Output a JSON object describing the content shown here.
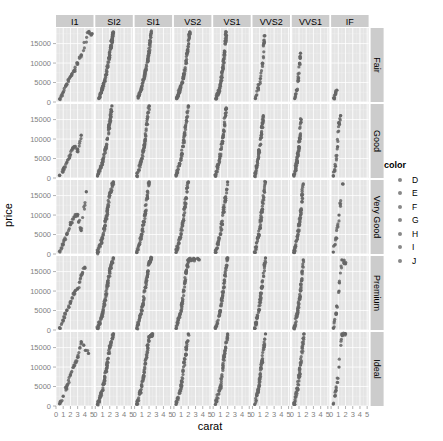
{
  "chart_data": {
    "type": "scatter",
    "title": "",
    "xlabel": "carat",
    "ylabel": "price",
    "facet_columns": [
      "I1",
      "SI2",
      "SI1",
      "VS2",
      "VS1",
      "VVS2",
      "VVS1",
      "IF"
    ],
    "facet_rows": [
      "Fair",
      "Good",
      "Very Good",
      "Premium",
      "Ideal"
    ],
    "x_ticks": [
      "0",
      "1",
      "2",
      "3",
      "4",
      "5"
    ],
    "xlim": [
      0,
      5.2
    ],
    "y_ticks": [
      "0",
      "5000",
      "10000",
      "15000"
    ],
    "ylim": [
      0,
      19000
    ],
    "grid": true,
    "legend": {
      "title": "color",
      "entries": [
        "D",
        "E",
        "F",
        "G",
        "H",
        "I",
        "J"
      ],
      "position": "right"
    },
    "point_color": "#666666",
    "panel_background": "#e5e5e5",
    "strip_background": "#cccccc",
    "approx_series": {
      "Fair": {
        "I1": [
          [
            0.5,
            800
          ],
          [
            1,
            2500
          ],
          [
            1.5,
            4500
          ],
          [
            2,
            6500
          ],
          [
            2.5,
            8000
          ],
          [
            3,
            10000
          ],
          [
            3.5,
            12000
          ],
          [
            4.5,
            18000
          ],
          [
            5,
            17500
          ]
        ],
        "SI2": [
          [
            0.5,
            900
          ],
          [
            1,
            3500
          ],
          [
            1.5,
            7000
          ],
          [
            2,
            12000
          ],
          [
            2.3,
            16000
          ],
          [
            2.5,
            18000
          ]
        ],
        "SI1": [
          [
            0.5,
            1000
          ],
          [
            1,
            4000
          ],
          [
            1.5,
            8000
          ],
          [
            2,
            12500
          ],
          [
            2.3,
            18000
          ]
        ],
        "VS2": [
          [
            0.4,
            900
          ],
          [
            0.9,
            3500
          ],
          [
            1.4,
            7000
          ],
          [
            1.9,
            13000
          ],
          [
            2.2,
            18000
          ]
        ],
        "VS1": [
          [
            0.4,
            900
          ],
          [
            0.9,
            3500
          ],
          [
            1.3,
            8000
          ],
          [
            1.6,
            13000
          ],
          [
            1.8,
            18000
          ]
        ],
        "VVS2": [
          [
            0.4,
            900
          ],
          [
            0.8,
            3500
          ],
          [
            1.1,
            6000
          ],
          [
            1.4,
            10000
          ],
          [
            1.6,
            15000
          ],
          [
            1.7,
            17000
          ]
        ],
        "VVS1": [
          [
            0.4,
            900
          ],
          [
            0.7,
            3000
          ],
          [
            0.9,
            6000
          ],
          [
            1.1,
            10000
          ],
          [
            1.2,
            12500
          ]
        ],
        "IF": [
          [
            0.4,
            900
          ],
          [
            0.6,
            2000
          ],
          [
            0.8,
            3000
          ]
        ]
      },
      "Good": {
        "I1": [
          [
            0.5,
            700
          ],
          [
            1,
            2200
          ],
          [
            1.5,
            4000
          ],
          [
            2,
            6000
          ],
          [
            2.5,
            8000
          ],
          [
            3,
            7000
          ],
          [
            3.5,
            11000
          ]
        ],
        "SI2": [
          [
            0.3,
            500
          ],
          [
            1,
            4000
          ],
          [
            1.5,
            8000
          ],
          [
            2,
            14000
          ],
          [
            2.3,
            18500
          ]
        ],
        "SI1": [
          [
            0.3,
            500
          ],
          [
            1,
            5000
          ],
          [
            1.5,
            10000
          ],
          [
            2,
            18500
          ]
        ],
        "VS2": [
          [
            0.3,
            500
          ],
          [
            1,
            5000
          ],
          [
            1.5,
            11000
          ],
          [
            2,
            18500
          ]
        ],
        "VS1": [
          [
            0.3,
            500
          ],
          [
            0.9,
            5000
          ],
          [
            1.4,
            11000
          ],
          [
            1.8,
            18000
          ]
        ],
        "VVS2": [
          [
            0.3,
            500
          ],
          [
            0.8,
            5000
          ],
          [
            1.2,
            11000
          ],
          [
            1.5,
            16000
          ]
        ],
        "VVS1": [
          [
            0.3,
            500
          ],
          [
            0.7,
            4000
          ],
          [
            1,
            8000
          ],
          [
            1.3,
            15000
          ]
        ],
        "IF": [
          [
            0.3,
            600
          ],
          [
            0.6,
            3000
          ],
          [
            0.9,
            8000
          ],
          [
            1.1,
            14000
          ],
          [
            1.3,
            16000
          ]
        ]
      },
      "Very Good": {
        "I1": [
          [
            0.5,
            700
          ],
          [
            1,
            2500
          ],
          [
            1.5,
            5000
          ],
          [
            2,
            7500
          ],
          [
            2.5,
            9500
          ],
          [
            3,
            10000
          ],
          [
            3.5,
            6000
          ],
          [
            4.2,
            16000
          ]
        ],
        "SI2": [
          [
            0.3,
            400
          ],
          [
            1,
            4000
          ],
          [
            1.5,
            9000
          ],
          [
            2,
            15000
          ],
          [
            2.5,
            18500
          ]
        ],
        "SI1": [
          [
            0.3,
            400
          ],
          [
            1,
            5000
          ],
          [
            1.5,
            11000
          ],
          [
            2,
            18500
          ]
        ],
        "VS2": [
          [
            0.3,
            400
          ],
          [
            1,
            5000
          ],
          [
            1.5,
            12000
          ],
          [
            2,
            18500
          ]
        ],
        "VS1": [
          [
            0.3,
            400
          ],
          [
            1,
            5000
          ],
          [
            1.5,
            12000
          ],
          [
            2,
            18500
          ]
        ],
        "VVS2": [
          [
            0.3,
            400
          ],
          [
            0.9,
            5000
          ],
          [
            1.3,
            11000
          ],
          [
            1.8,
            18500
          ]
        ],
        "VVS1": [
          [
            0.3,
            400
          ],
          [
            0.8,
            4500
          ],
          [
            1.2,
            10000
          ],
          [
            1.6,
            18000
          ]
        ],
        "IF": [
          [
            0.3,
            500
          ],
          [
            0.7,
            4000
          ],
          [
            1.1,
            10000
          ],
          [
            1.6,
            18000
          ]
        ]
      },
      "Premium": {
        "I1": [
          [
            0.5,
            600
          ],
          [
            1,
            2500
          ],
          [
            1.5,
            5000
          ],
          [
            2,
            7000
          ],
          [
            2.5,
            9500
          ],
          [
            3,
            10500
          ],
          [
            3.5,
            14000
          ],
          [
            4,
            16000
          ]
        ],
        "SI2": [
          [
            0.3,
            400
          ],
          [
            1,
            4000
          ],
          [
            1.5,
            9000
          ],
          [
            2,
            15000
          ],
          [
            2.5,
            18500
          ]
        ],
        "SI1": [
          [
            0.3,
            400
          ],
          [
            1,
            5000
          ],
          [
            1.5,
            11000
          ],
          [
            2,
            17000
          ],
          [
            2.3,
            18500
          ]
        ],
        "VS2": [
          [
            0.3,
            400
          ],
          [
            1,
            5000
          ],
          [
            1.5,
            12000
          ],
          [
            2,
            18000
          ],
          [
            3.5,
            18000
          ]
        ],
        "VS1": [
          [
            0.3,
            400
          ],
          [
            1,
            5000
          ],
          [
            1.5,
            12000
          ],
          [
            2,
            18500
          ]
        ],
        "VVS2": [
          [
            0.3,
            400
          ],
          [
            0.9,
            5000
          ],
          [
            1.3,
            11000
          ],
          [
            1.8,
            18500
          ]
        ],
        "VVS1": [
          [
            0.3,
            400
          ],
          [
            0.8,
            4500
          ],
          [
            1.2,
            10000
          ],
          [
            1.6,
            18000
          ]
        ],
        "IF": [
          [
            0.3,
            500
          ],
          [
            0.7,
            4000
          ],
          [
            1.1,
            10000
          ],
          [
            1.5,
            18000
          ],
          [
            2,
            17000
          ]
        ]
      },
      "Ideal": {
        "I1": [
          [
            0.5,
            600
          ],
          [
            1,
            2500
          ],
          [
            1.5,
            5000
          ],
          [
            2,
            8000
          ],
          [
            2.5,
            10500
          ],
          [
            3,
            12500
          ],
          [
            3.5,
            16500
          ],
          [
            4.5,
            13500
          ]
        ],
        "SI2": [
          [
            0.3,
            400
          ],
          [
            1,
            4000
          ],
          [
            1.5,
            9000
          ],
          [
            2,
            15000
          ],
          [
            2.5,
            18500
          ]
        ],
        "SI1": [
          [
            0.3,
            400
          ],
          [
            1,
            5000
          ],
          [
            1.5,
            11000
          ],
          [
            2,
            17500
          ],
          [
            2.5,
            18500
          ]
        ],
        "VS2": [
          [
            0.3,
            400
          ],
          [
            1,
            5000
          ],
          [
            1.5,
            12000
          ],
          [
            2,
            18500
          ]
        ],
        "VS1": [
          [
            0.3,
            400
          ],
          [
            1,
            5000
          ],
          [
            1.5,
            12500
          ],
          [
            2,
            18500
          ]
        ],
        "VVS2": [
          [
            0.3,
            400
          ],
          [
            0.9,
            5000
          ],
          [
            1.3,
            11000
          ],
          [
            1.8,
            18500
          ]
        ],
        "VVS1": [
          [
            0.3,
            400
          ],
          [
            0.8,
            4500
          ],
          [
            1.2,
            10500
          ],
          [
            1.7,
            18500
          ]
        ],
        "IF": [
          [
            0.3,
            500
          ],
          [
            0.7,
            4000
          ],
          [
            1.1,
            10000
          ],
          [
            1.5,
            18500
          ],
          [
            2,
            18500
          ]
        ]
      }
    }
  }
}
